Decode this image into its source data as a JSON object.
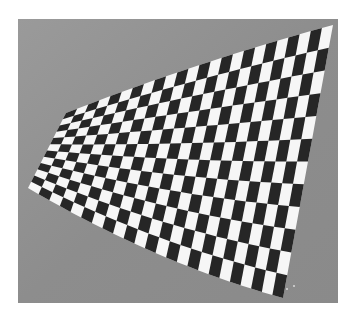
{
  "image": {
    "width": 352,
    "height": 319,
    "page_background": "#ffffff",
    "frame": {
      "x": 18,
      "y": 19,
      "width": 320,
      "height": 284,
      "color": "#8e8e8e",
      "edge_color": "#9a9a9a"
    },
    "checkerboard": {
      "cols": 24,
      "rows": 12,
      "dark_color": "#262626",
      "light_color": "#f6f6f6",
      "corners": {
        "top_left": [
          66,
          113
        ],
        "top_right": [
          333,
          25
        ],
        "bottom_right": [
          283,
          298
        ],
        "bottom_left": [
          28,
          188
        ]
      },
      "bottom_bow": 10,
      "top_bow": -4
    },
    "specks": [
      [
        287,
        289
      ],
      [
        294,
        286
      ]
    ]
  }
}
